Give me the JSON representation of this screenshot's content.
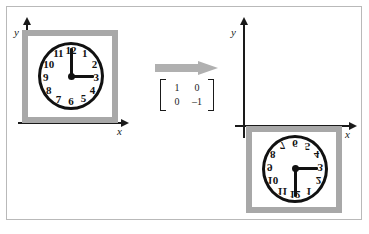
{
  "figure": {
    "background_color": "#ffffff",
    "border_color": "#b9b9b9"
  },
  "colors": {
    "axis": "#1a1a1a",
    "frame_gray": "#a8a8a8",
    "arrow_gray": "#b0b0b0",
    "clock_outline": "#111111",
    "clock_face": "#ffffff"
  },
  "left_panel": {
    "name": "original",
    "y_axis_label": "y",
    "x_axis_label": "x",
    "quadrant": "first",
    "clock": {
      "time_displayed": "3:00",
      "hour_hand_points_to": "3",
      "minute_hand_points_to": "12",
      "mirrored": false,
      "numerals": [
        "1",
        "2",
        "3",
        "4",
        "5",
        "6",
        "7",
        "8",
        "9",
        "10",
        "11",
        "12"
      ]
    }
  },
  "transform": {
    "arrow_icon": "right-arrow-icon",
    "matrix_label": "transformation matrix",
    "matrix_rows": [
      [
        "1",
        "0"
      ],
      [
        "0",
        "–1"
      ]
    ]
  },
  "right_panel": {
    "name": "transformed",
    "y_axis_label": "y",
    "x_axis_label": "x",
    "quadrant": "fourth",
    "clock": {
      "time_displayed": "3:00",
      "hour_hand_points_to": "3",
      "minute_hand_points_to": "12",
      "mirrored": true,
      "numerals": [
        "1",
        "2",
        "3",
        "4",
        "5",
        "6",
        "7",
        "8",
        "9",
        "10",
        "11",
        "12"
      ]
    }
  }
}
